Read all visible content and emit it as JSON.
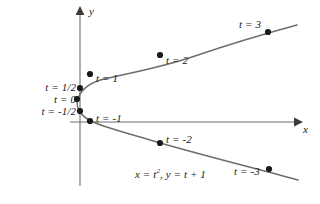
{
  "figure": {
    "caption_equation_prefix": "x = t",
    "caption_equation_exponent": "2",
    "caption_equation_suffix": ", y = t + 1",
    "equation_text": "x = t2, y = t + 1",
    "axis_x_label": "x",
    "axis_y_label": "y",
    "curve_color": "#6e6e6e",
    "axis_color": "#6e6e6e",
    "point_color": "#1a1a1a",
    "text_color": "#1a1a1a",
    "background_color": "#ffffff"
  },
  "point_labels": [
    {
      "id": "t3",
      "text": "t = 3",
      "px": 239,
      "py": 19
    },
    {
      "id": "t2",
      "text": "t = 2",
      "px": 166,
      "py": 55
    },
    {
      "id": "t1",
      "text": "t = 1",
      "px": 96,
      "py": 73
    },
    {
      "id": "thalf",
      "text": "t = 1/2",
      "px": 24,
      "py": 82
    },
    {
      "id": "t0",
      "text": "t = 0",
      "px": 38,
      "py": 94
    },
    {
      "id": "tmhalf",
      "text": "t = -1/2",
      "px": 17,
      "py": 106
    },
    {
      "id": "tm1",
      "text": "t = -1",
      "px": 96,
      "py": 113
    },
    {
      "id": "tm2",
      "text": "t = -2",
      "px": 166,
      "py": 134
    },
    {
      "id": "tm3",
      "text": "t = -3",
      "px": 234,
      "py": 166
    }
  ],
  "chart_data": {
    "type": "scatter",
    "title": "",
    "subtitle": "",
    "xlabel": "x",
    "ylabel": "y",
    "equation": "x = t^2, y = t + 1",
    "grid": false,
    "legend": "none",
    "axis_origin_px": {
      "x": 80,
      "y": 122
    },
    "x_axis_arrow_end_px": {
      "x": 300,
      "y": 122
    },
    "y_axis_arrow_end_px": {
      "x": 80,
      "y": 8
    },
    "parameter_name": "t",
    "parameter_values": [
      3,
      2,
      1,
      0.5,
      0,
      -0.5,
      -1,
      -2,
      -3
    ],
    "points": [
      {
        "t": 3,
        "x": 9,
        "y": 4,
        "px": 268,
        "py": 32,
        "label": "t = 3"
      },
      {
        "t": 2,
        "x": 4,
        "y": 3,
        "px": 160,
        "py": 55,
        "label": "t = 2"
      },
      {
        "t": 1,
        "x": 1,
        "y": 2,
        "px": 90,
        "py": 74,
        "label": "t = 1"
      },
      {
        "t": 0.5,
        "x": 0.25,
        "y": 1.5,
        "px": 80,
        "py": 88,
        "label": "t = 1/2"
      },
      {
        "t": 0,
        "x": 0,
        "y": 1,
        "px": 77,
        "py": 99,
        "label": "t = 0"
      },
      {
        "t": -0.5,
        "x": 0.25,
        "y": 0.5,
        "px": 80,
        "py": 111,
        "label": "t = -1/2"
      },
      {
        "t": -1,
        "x": 1,
        "y": 0,
        "px": 90,
        "py": 121,
        "label": "t = -1"
      },
      {
        "t": -2,
        "x": 4,
        "y": -1,
        "px": 160,
        "py": 143,
        "label": "t = -2"
      },
      {
        "t": -3,
        "x": 9,
        "y": -2,
        "px": 269,
        "py": 169,
        "label": "t = -3"
      }
    ],
    "curve_path_px": "M 297,25 C 275,31 230,44 195,56 C 160,68 125,74 104,79 C 92,82 83,88 79,96 C 75,104 78,112 86,118 C 96,125 120,131 150,140 C 190,152 250,167 298,180",
    "x_range_data": [
      0,
      10
    ],
    "y_range_data": [
      -2.5,
      4.5
    ]
  }
}
